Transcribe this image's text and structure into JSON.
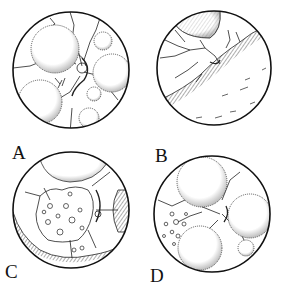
{
  "figure": {
    "panels": [
      {
        "id": "A",
        "label": "A",
        "description": "circular field with several large stippled spheres and branching vessels around a central disc"
      },
      {
        "id": "B",
        "label": "B",
        "description": "circular field with a sphere at top and a large hatched mass across the lower half, fine vessels above"
      },
      {
        "id": "C",
        "label": "C",
        "description": "circular field with a dotted central region, spheres at top and right edge, hatched mass along bottom-left"
      },
      {
        "id": "D",
        "label": "D",
        "description": "circular field with three large spheres, a small sphere and scattered small circles on the left"
      }
    ]
  }
}
